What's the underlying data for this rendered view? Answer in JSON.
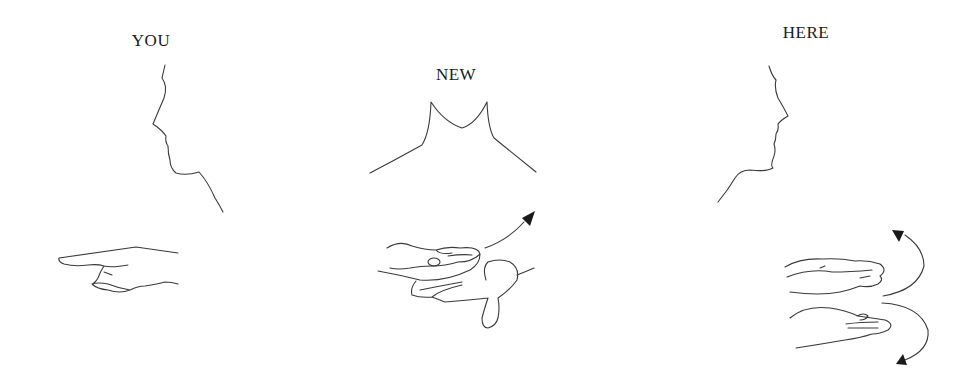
{
  "signs": [
    {
      "label": "YOU",
      "label_x": 151,
      "label_y": 31
    },
    {
      "label": "NEW",
      "label_x": 456,
      "label_y": 65
    },
    {
      "label": "HERE",
      "label_x": 806,
      "label_y": 23
    }
  ],
  "colors": {
    "background": "#ffffff",
    "line": "#3a3a3a",
    "text": "#1a1a1a"
  }
}
